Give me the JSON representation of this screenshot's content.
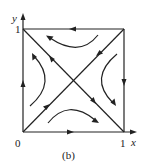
{
  "figure": {
    "caption": "(b)",
    "axes": {
      "x_label": "x",
      "y_label": "y",
      "origin_label": "0",
      "x_tick_label": "1",
      "y_tick_label": "1"
    },
    "colors": {
      "stroke": "#222222",
      "background": "#ffffff"
    }
  }
}
